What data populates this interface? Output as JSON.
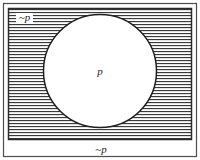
{
  "diagram": {
    "kind": "logic-venn-diagram",
    "colors": {
      "background": "#ffffff",
      "frame_border": "#4d4d4d",
      "rectangle_border": "#2b2b2b",
      "hatch_line": "#3a3a3a",
      "circle_border": "#1f1f1f",
      "circle_fill": "#ffffff",
      "text": "#1a1a1a"
    },
    "frame": {
      "x": 3,
      "y": 3,
      "width": 194,
      "height": 154
    },
    "rectangle": {
      "x": 8,
      "y": 8,
      "width": 184,
      "height": 132
    },
    "circle": {
      "cx": 100,
      "cy": 71,
      "r": 57
    },
    "hatch": {
      "orientation": "horizontal",
      "spacing": 3,
      "line_width": 1
    },
    "labels": {
      "outside_top_left": {
        "text": "~p",
        "x": 24,
        "y": 21,
        "font_size": 11,
        "meaning": "not-p region (hatched area inside rectangle, outside circle)"
      },
      "inside_circle": {
        "text": "p",
        "x": 100,
        "y": 74,
        "font_size": 11,
        "meaning": "p region (interior of circle)"
      },
      "below_rectangle": {
        "text": "~p",
        "x": 101,
        "y": 153,
        "font_size": 11,
        "meaning": "caption naming the hatched complement region"
      }
    }
  }
}
